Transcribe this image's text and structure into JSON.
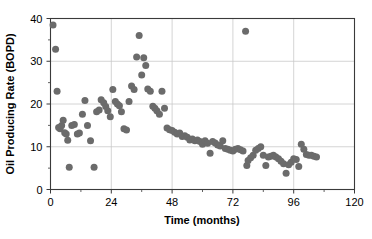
{
  "chart_data": {
    "type": "scatter",
    "title": "",
    "xlabel": "Time (months)",
    "ylabel": "Oil Producing Rate (BOPD)",
    "xlim": [
      0,
      120
    ],
    "ylim": [
      0,
      40
    ],
    "xticks": [
      0,
      24,
      48,
      72,
      96,
      120
    ],
    "yticks": [
      0,
      10,
      20,
      30,
      40
    ],
    "xtick_labels": [
      "0",
      "24",
      "48",
      "72",
      "96",
      "120"
    ],
    "ytick_labels": [
      "0",
      "10",
      "20",
      "30",
      "40"
    ],
    "x_minor_tick_interval": 12,
    "y_minor_tick_interval": 5,
    "grid": true,
    "grid_color": "#c9c9c9",
    "marker_color": "#6b6b6b",
    "marker_shape": "circle",
    "marker_size_px": 4.6,
    "axis_color": "#3a3a3a",
    "series": [
      {
        "name": "Oil Producing Rate",
        "points": [
          [
            1.0,
            38.5
          ],
          [
            2.0,
            32.8
          ],
          [
            2.6,
            23.0
          ],
          [
            3.2,
            14.5
          ],
          [
            3.8,
            14.2
          ],
          [
            4.4,
            15.0
          ],
          [
            5.0,
            16.2
          ],
          [
            5.6,
            13.3
          ],
          [
            6.2,
            13.0
          ],
          [
            6.8,
            11.5
          ],
          [
            7.4,
            5.2
          ],
          [
            8.4,
            15.0
          ],
          [
            9.4,
            15.2
          ],
          [
            10.6,
            13.0
          ],
          [
            11.4,
            13.2
          ],
          [
            12.6,
            17.6
          ],
          [
            13.6,
            20.8
          ],
          [
            14.6,
            15.0
          ],
          [
            15.8,
            11.4
          ],
          [
            17.2,
            5.2
          ],
          [
            18.2,
            18.2
          ],
          [
            19.2,
            18.6
          ],
          [
            20.0,
            21.0
          ],
          [
            21.0,
            20.3
          ],
          [
            21.8,
            19.4
          ],
          [
            22.6,
            18.4
          ],
          [
            23.6,
            17.0
          ],
          [
            24.6,
            23.4
          ],
          [
            25.6,
            20.6
          ],
          [
            26.4,
            20.0
          ],
          [
            27.2,
            19.6
          ],
          [
            28.0,
            18.2
          ],
          [
            29.0,
            14.2
          ],
          [
            30.0,
            13.9
          ],
          [
            31.0,
            20.6
          ],
          [
            32.0,
            24.2
          ],
          [
            33.0,
            23.4
          ],
          [
            34.0,
            31.0
          ],
          [
            35.0,
            36.0
          ],
          [
            36.0,
            26.8
          ],
          [
            36.8,
            30.8
          ],
          [
            37.6,
            29.0
          ],
          [
            38.4,
            23.5
          ],
          [
            39.4,
            23.0
          ],
          [
            40.4,
            19.5
          ],
          [
            41.2,
            19.0
          ],
          [
            42.0,
            18.4
          ],
          [
            43.0,
            17.6
          ],
          [
            44.0,
            23.0
          ],
          [
            45.0,
            19.0
          ],
          [
            46.0,
            14.4
          ],
          [
            47.0,
            14.0
          ],
          [
            48.0,
            13.8
          ],
          [
            49.0,
            13.4
          ],
          [
            50.0,
            13.0
          ],
          [
            51.0,
            13.2
          ],
          [
            52.0,
            12.4
          ],
          [
            53.0,
            12.6
          ],
          [
            54.0,
            12.2
          ],
          [
            55.0,
            11.6
          ],
          [
            56.0,
            11.8
          ],
          [
            57.0,
            11.4
          ],
          [
            58.0,
            11.6
          ],
          [
            59.0,
            11.2
          ],
          [
            60.0,
            10.6
          ],
          [
            61.0,
            11.4
          ],
          [
            62.0,
            10.8
          ],
          [
            63.0,
            8.5
          ],
          [
            64.0,
            11.2
          ],
          [
            65.0,
            10.9
          ],
          [
            66.0,
            10.4
          ],
          [
            67.0,
            10.2
          ],
          [
            68.0,
            11.4
          ],
          [
            69.0,
            9.6
          ],
          [
            70.0,
            9.4
          ],
          [
            71.0,
            9.2
          ],
          [
            72.0,
            9.0
          ],
          [
            73.0,
            9.4
          ],
          [
            74.0,
            9.6
          ],
          [
            75.0,
            9.3
          ],
          [
            76.0,
            9.0
          ],
          [
            77.0,
            37.0
          ],
          [
            77.5,
            5.6
          ],
          [
            78.0,
            6.8
          ],
          [
            79.0,
            7.4
          ],
          [
            80.0,
            8.0
          ],
          [
            81.0,
            9.2
          ],
          [
            82.0,
            9.6
          ],
          [
            83.0,
            10.0
          ],
          [
            84.0,
            8.0
          ],
          [
            85.0,
            5.6
          ],
          [
            86.0,
            7.6
          ],
          [
            87.0,
            7.8
          ],
          [
            88.0,
            8.0
          ],
          [
            89.0,
            7.6
          ],
          [
            90.0,
            7.2
          ],
          [
            91.0,
            6.6
          ],
          [
            92.0,
            6.0
          ],
          [
            93.0,
            3.8
          ],
          [
            94.0,
            5.8
          ],
          [
            95.0,
            6.4
          ],
          [
            96.0,
            7.2
          ],
          [
            97.0,
            7.0
          ],
          [
            98.0,
            5.4
          ],
          [
            99.0,
            10.6
          ],
          [
            100.0,
            9.4
          ],
          [
            101.0,
            8.2
          ],
          [
            102.0,
            8.0
          ],
          [
            103.0,
            8.0
          ],
          [
            104.0,
            7.8
          ],
          [
            105.0,
            7.6
          ]
        ]
      }
    ]
  }
}
